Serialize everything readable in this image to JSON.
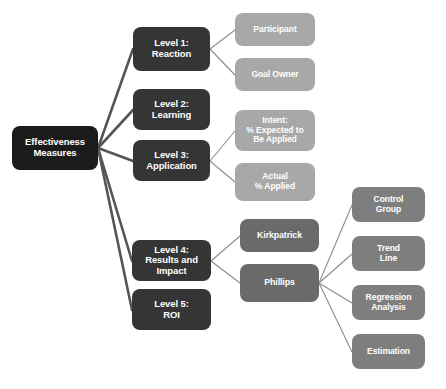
{
  "diagram": {
    "title": "Effectiveness Measures",
    "colors": {
      "background": "#ffffff",
      "root_box": "#1b1b1b",
      "level_box": "#353535",
      "light_box": "#a8a8a8",
      "mid_box": "#6a6a6a",
      "right_box": "#7e7e7e",
      "thick_connector": "#555555",
      "thin_connector": "#8c8c8c",
      "label_text": "#ffffff"
    },
    "nodes": [
      {
        "id": "root",
        "label": "Effectiveness\nMeasures",
        "style": "node-root",
        "x": 12,
        "y": 126,
        "w": 86,
        "h": 44
      },
      {
        "id": "level1",
        "label": "Level 1:\nReaction",
        "style": "node-level",
        "x": 133,
        "y": 27,
        "w": 77,
        "h": 44
      },
      {
        "id": "level2",
        "label": "Level 2:\nLearning",
        "style": "node-level",
        "x": 133,
        "y": 89,
        "w": 77,
        "h": 41
      },
      {
        "id": "level3",
        "label": "Level 3:\nApplication",
        "style": "node-level",
        "x": 133,
        "y": 140,
        "w": 77,
        "h": 41
      },
      {
        "id": "level4",
        "label": "Level 4:\nResults and Impact",
        "style": "node-level",
        "x": 132,
        "y": 240,
        "w": 79,
        "h": 41
      },
      {
        "id": "level5",
        "label": "Level 5:\nROI",
        "style": "node-level",
        "x": 132,
        "y": 289,
        "w": 79,
        "h": 41
      },
      {
        "id": "participant",
        "label": "Participant",
        "style": "node-light",
        "x": 235,
        "y": 13,
        "w": 80,
        "h": 33
      },
      {
        "id": "goal-owner",
        "label": "Goal Owner",
        "style": "node-light",
        "x": 235,
        "y": 58,
        "w": 80,
        "h": 33
      },
      {
        "id": "intent",
        "label": "Intent:\n% Expected to\nBe Applied",
        "style": "node-light",
        "x": 235,
        "y": 110,
        "w": 80,
        "h": 41
      },
      {
        "id": "actual",
        "label": "Actual\n% Applied",
        "style": "node-light",
        "x": 235,
        "y": 163,
        "w": 80,
        "h": 38
      },
      {
        "id": "kirkpatrick",
        "label": "Kirkpatrick",
        "style": "node-mid",
        "x": 240,
        "y": 219,
        "w": 79,
        "h": 33
      },
      {
        "id": "phillips",
        "label": "Phillips",
        "style": "node-mid",
        "x": 240,
        "y": 264,
        "w": 79,
        "h": 38
      },
      {
        "id": "control-group",
        "label": "Control\nGroup",
        "style": "node-right",
        "x": 352,
        "y": 187,
        "w": 73,
        "h": 35
      },
      {
        "id": "trend-line",
        "label": "Trend\nLine",
        "style": "node-right",
        "x": 352,
        "y": 236,
        "w": 73,
        "h": 35
      },
      {
        "id": "regression-analysis",
        "label": "Regression\nAnalysis",
        "style": "node-right",
        "x": 352,
        "y": 285,
        "w": 73,
        "h": 35
      },
      {
        "id": "estimation",
        "label": "Estimation",
        "style": "node-right",
        "x": 352,
        "y": 334,
        "w": 73,
        "h": 35
      }
    ],
    "edges": [
      {
        "from": "root",
        "to": "level1",
        "weight": "thick",
        "x1": 98,
        "y1": 148,
        "x2": 133,
        "y2": 49
      },
      {
        "from": "root",
        "to": "level2",
        "weight": "thick",
        "x1": 98,
        "y1": 148,
        "x2": 133,
        "y2": 110
      },
      {
        "from": "root",
        "to": "level3",
        "weight": "thick",
        "x1": 98,
        "y1": 148,
        "x2": 133,
        "y2": 161
      },
      {
        "from": "root",
        "to": "level4",
        "weight": "thick",
        "x1": 98,
        "y1": 148,
        "x2": 132,
        "y2": 261
      },
      {
        "from": "root",
        "to": "level5",
        "weight": "thick",
        "x1": 98,
        "y1": 148,
        "x2": 132,
        "y2": 310
      },
      {
        "from": "level1",
        "to": "participant",
        "weight": "thin",
        "x1": 210,
        "y1": 49,
        "x2": 235,
        "y2": 30
      },
      {
        "from": "level1",
        "to": "goal-owner",
        "weight": "thin",
        "x1": 210,
        "y1": 49,
        "x2": 235,
        "y2": 75
      },
      {
        "from": "level3",
        "to": "intent",
        "weight": "thin",
        "x1": 210,
        "y1": 161,
        "x2": 235,
        "y2": 131
      },
      {
        "from": "level3",
        "to": "actual",
        "weight": "thin",
        "x1": 210,
        "y1": 161,
        "x2": 235,
        "y2": 182
      },
      {
        "from": "level4",
        "to": "kirkpatrick",
        "weight": "thin",
        "x1": 211,
        "y1": 261,
        "x2": 240,
        "y2": 236
      },
      {
        "from": "level4",
        "to": "phillips",
        "weight": "thin",
        "x1": 211,
        "y1": 261,
        "x2": 240,
        "y2": 283
      },
      {
        "from": "phillips",
        "to": "control-group",
        "weight": "thin",
        "x1": 319,
        "y1": 283,
        "x2": 352,
        "y2": 205
      },
      {
        "from": "phillips",
        "to": "trend-line",
        "weight": "thin",
        "x1": 319,
        "y1": 283,
        "x2": 352,
        "y2": 254
      },
      {
        "from": "phillips",
        "to": "regression-analysis",
        "weight": "thin",
        "x1": 319,
        "y1": 283,
        "x2": 352,
        "y2": 303
      },
      {
        "from": "phillips",
        "to": "estimation",
        "weight": "thin",
        "x1": 319,
        "y1": 283,
        "x2": 352,
        "y2": 352
      }
    ]
  }
}
